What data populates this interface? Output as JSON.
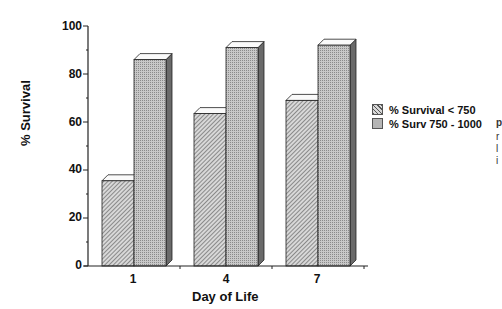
{
  "chart_data": {
    "type": "bar",
    "title": "",
    "xlabel": "Day of Life",
    "ylabel": "% Survival",
    "categories": [
      "1",
      "4",
      "7"
    ],
    "series": [
      {
        "name": "% Survival < 750",
        "values": [
          35.5,
          63.5,
          69
        ],
        "pattern": "diagonal-hatch"
      },
      {
        "name": "% Surv 750 - 1000",
        "values": [
          86,
          91,
          92
        ],
        "pattern": "dotted-gray"
      }
    ],
    "ylim": [
      0,
      100
    ],
    "yticks": [
      "0",
      "20",
      "40",
      "60",
      "80",
      "100"
    ],
    "grid": false,
    "legend_position": "right",
    "style": "3d-bar"
  },
  "axis": {
    "y_label": "% Survival",
    "x_label": "Day of Life",
    "y_ticks": [
      "100",
      "80",
      "60",
      "40",
      "20",
      "0"
    ],
    "x_ticks": [
      "1",
      "4",
      "7"
    ]
  },
  "legend": {
    "items": [
      {
        "label": "% Survival < 750"
      },
      {
        "label": "% Surv 750 - 1000"
      }
    ]
  },
  "cutoff_text": [
    "p",
    "r",
    "l",
    "i"
  ]
}
